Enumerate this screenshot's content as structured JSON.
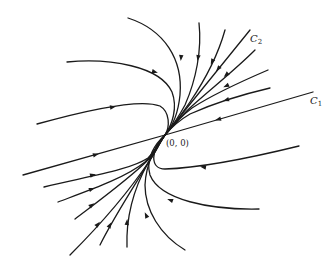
{
  "diagram": {
    "type": "phase-portrait",
    "labels": {
      "origin": "(0, 0)",
      "c1_main": "C",
      "c1_sub": "1",
      "c2_main": "C",
      "c2_sub": "2"
    },
    "origin_point": {
      "x": 165,
      "y": 135
    },
    "stroke_color": "#1a1a1a",
    "background": "#ffffff",
    "trajectories": [
      {
        "id": "c1-line",
        "d": "M 313 92 L 165 135 L 23 175",
        "arrows": [
          {
            "x": 218,
            "y": 119.5,
            "angle": 164
          },
          {
            "x": 96,
            "y": 154.5,
            "angle": -16
          }
        ]
      },
      {
        "id": "c2-line",
        "d": "M 250 30 L 165 135",
        "arrows": [
          {
            "x": 218,
            "y": 69,
            "angle": 129
          }
        ]
      },
      {
        "id": "top-1",
        "d": "M 128 18 C 165 30, 183 60, 180 95 C 178 115, 172 127, 165 135",
        "arrows": [
          {
            "x": 181,
            "y": 58,
            "angle": 95
          }
        ]
      },
      {
        "id": "top-2",
        "d": "M 199 23 C 202 50, 196 80, 185 105 C 177 120, 170 129, 165 135",
        "arrows": [
          {
            "x": 198,
            "y": 58,
            "angle": 100
          }
        ]
      },
      {
        "id": "top-3",
        "d": "M 225 30 C 218 55, 205 80, 190 102 C 180 117, 171 128, 165 135",
        "arrows": [
          {
            "x": 212,
            "y": 62,
            "angle": 115
          }
        ]
      },
      {
        "id": "top-4",
        "d": "M 255 50 C 235 70, 212 88, 192 106 C 180 117, 170 129, 165 135",
        "arrows": [
          {
            "x": 226,
            "y": 75,
            "angle": 138
          }
        ]
      },
      {
        "id": "top-5",
        "d": "M 268 70 C 240 82, 212 95, 192 108 C 180 117, 170 129, 165 135",
        "arrows": [
          {
            "x": 226,
            "y": 86,
            "angle": 155
          }
        ]
      },
      {
        "id": "top-6",
        "d": "M 270 88 C 240 95, 210 105, 190 114 C 178 121, 170 129, 165 135",
        "arrows": [
          {
            "x": 226,
            "y": 100,
            "angle": 163
          }
        ]
      },
      {
        "id": "left-top-1",
        "d": "M 67 62 C 110 58, 160 66, 172 92 C 178 108, 172 125, 165 135",
        "arrows": [
          {
            "x": 155,
            "y": 72,
            "angle": 15
          }
        ]
      },
      {
        "id": "left-top-2",
        "d": "M 37 124 C 80 112, 140 98, 160 106 C 170 112, 170 127, 165 135",
        "arrows": [
          {
            "x": 113,
            "y": 107,
            "angle": -10
          }
        ]
      },
      {
        "id": "right-bot-1",
        "d": "M 299 146 C 250 158, 200 168, 165 169 C 150 169, 150 150, 165 135",
        "arrows": [
          {
            "x": 203,
            "y": 167,
            "angle": 190
          }
        ]
      },
      {
        "id": "right-bot-2",
        "d": "M 259 209 C 210 210, 160 200, 150 175 C 145 158, 156 143, 165 135",
        "arrows": [
          {
            "x": 170,
            "y": 200,
            "angle": 200
          }
        ]
      },
      {
        "id": "right-bot-3",
        "d": "M 185 250 C 160 235, 145 210, 145 185 C 146 163, 156 145, 165 135",
        "arrows": [
          {
            "x": 146,
            "y": 215,
            "angle": 245
          }
        ]
      },
      {
        "id": "left-bot-1",
        "d": "M 44 187 C 90 176, 130 170, 148 158 C 156 150, 161 140, 165 135",
        "arrows": [
          {
            "x": 93,
            "y": 175,
            "angle": -14
          }
        ]
      },
      {
        "id": "left-bot-2",
        "d": "M 58 202 C 90 190, 125 178, 145 162 C 155 152, 161 140, 165 135",
        "arrows": [
          {
            "x": 92,
            "y": 189,
            "angle": -20
          }
        ]
      },
      {
        "id": "left-bot-3",
        "d": "M 75 219 C 100 200, 130 178, 148 160 C 156 150, 161 140, 165 135",
        "arrows": [
          {
            "x": 92,
            "y": 205,
            "angle": -37
          }
        ]
      },
      {
        "id": "left-bot-4",
        "d": "M 70 255 C 100 225, 130 190, 150 160 C 157 150, 161 140, 165 135",
        "arrows": [
          {
            "x": 98,
            "y": 224,
            "angle": -50
          }
        ]
      },
      {
        "id": "left-bot-5",
        "d": "M 100 245 C 115 215, 135 185, 150 160 C 157 150, 161 140, 165 135",
        "arrows": [
          {
            "x": 110,
            "y": 225,
            "angle": -62
          }
        ]
      },
      {
        "id": "left-bot-6",
        "d": "M 127 247 C 126 220, 133 190, 148 163 C 156 150, 161 140, 165 135",
        "arrows": [
          {
            "x": 127,
            "y": 222,
            "angle": -86
          }
        ]
      }
    ]
  }
}
